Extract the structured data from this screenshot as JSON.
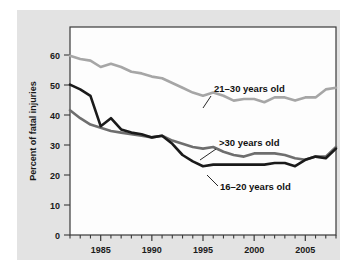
{
  "chart_data": {
    "type": "line",
    "title": "",
    "subtitle": "",
    "xlabel": "",
    "ylabel": "Percent of fatal injuries",
    "xlim": [
      1982,
      2008
    ],
    "ylim": [
      0,
      65
    ],
    "y_ticks": [
      0,
      10,
      20,
      30,
      40,
      50,
      60
    ],
    "x_ticks_labeled": [
      1985,
      1990,
      1995,
      2000,
      2005
    ],
    "x_tick_step_minor": 1,
    "grid": false,
    "legend_position": "inline-annotations",
    "x": [
      1982,
      1983,
      1984,
      1985,
      1986,
      1987,
      1988,
      1989,
      1990,
      1991,
      1992,
      1993,
      1994,
      1995,
      1996,
      1997,
      1998,
      1999,
      2000,
      2001,
      2002,
      2003,
      2004,
      2005,
      2006,
      2007,
      2008
    ],
    "series": [
      {
        "name": "21-30 years old",
        "label": "21–30 years old",
        "color": "#a6a6a6",
        "width": 2.6,
        "values": [
          56,
          55,
          54.5,
          52.5,
          53.5,
          52.5,
          51,
          50.5,
          49.5,
          49,
          47.5,
          46,
          44.5,
          43.5,
          44.5,
          43.5,
          42,
          42.5,
          42.5,
          41.5,
          43,
          43,
          42,
          43,
          43,
          45.5,
          46
        ]
      },
      {
        "name": ">30 years old",
        "label": ">30 years old",
        "color": "#6e6e6e",
        "width": 2.6,
        "values": [
          39,
          36.5,
          34.5,
          33.5,
          32.5,
          32,
          31.5,
          31,
          30.5,
          31,
          29.5,
          28.5,
          27.5,
          27,
          27.5,
          26,
          25,
          24.5,
          25.5,
          25.5,
          25.5,
          25,
          24,
          23.5,
          24.5,
          24.5,
          27.5
        ]
      },
      {
        "name": "16-20 years old",
        "label": "16–20 years old",
        "color": "#1a1a1a",
        "width": 2.6,
        "values": [
          47,
          45.5,
          43.5,
          34,
          36.5,
          33,
          32,
          31.5,
          30.5,
          31,
          28.5,
          25,
          23,
          21.5,
          22,
          22,
          22,
          22,
          22,
          22,
          22.5,
          22.5,
          21.5,
          23.5,
          24.5,
          24,
          27
        ]
      }
    ],
    "annotations": [
      {
        "name": "annotation-21-30",
        "text": "21–30 years old",
        "text_x": 214,
        "text_y": 92,
        "leader": [
          [
            211,
            96
          ],
          [
            203,
            108
          ]
        ]
      },
      {
        "name": "annotation-over-30",
        "text": ">30 years old",
        "text_x": 219,
        "text_y": 146,
        "leader": [
          [
            216,
            149
          ],
          [
            200,
            160
          ]
        ]
      },
      {
        "name": "annotation-16-20",
        "text": "16–20 years old",
        "text_x": 220,
        "text_y": 190,
        "leader": [
          [
            218,
            186
          ],
          [
            207,
            175
          ]
        ]
      }
    ],
    "colors": {
      "panel_background": "#e3e3e3",
      "plot_background": "#fdfdfd",
      "axis": "#3a3a3a",
      "text": "#1a1a1a"
    }
  }
}
